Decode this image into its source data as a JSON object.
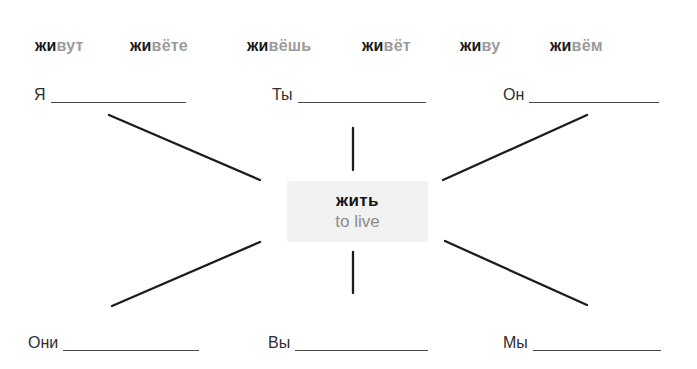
{
  "word_bank": {
    "items": [
      {
        "stem": "жи",
        "ending": "вут"
      },
      {
        "stem": "жи",
        "ending": "вёте"
      },
      {
        "stem": "жи",
        "ending": "вёшь"
      },
      {
        "stem": "жи",
        "ending": "вёт"
      },
      {
        "stem": "жи",
        "ending": "ву"
      },
      {
        "stem": "жи",
        "ending": "вём"
      }
    ]
  },
  "center": {
    "verb": "жить",
    "translation": "to live"
  },
  "prompts": [
    {
      "pronoun": "Я",
      "answer": ""
    },
    {
      "pronoun": "Ты",
      "answer": ""
    },
    {
      "pronoun": "Он",
      "answer": ""
    },
    {
      "pronoun": "Они",
      "answer": ""
    },
    {
      "pronoun": "Вы",
      "answer": ""
    },
    {
      "pronoun": "Мы",
      "answer": ""
    }
  ],
  "colors": {
    "stem": "#1a1a1a",
    "ending": "#9b9b9b",
    "translation": "#8c8c8c",
    "box_bg": "#f2f2f2",
    "line": "#1c1c1c"
  }
}
